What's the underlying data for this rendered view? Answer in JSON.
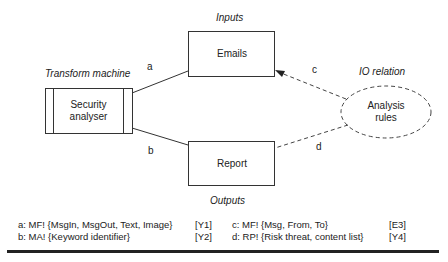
{
  "diagram": {
    "labels": {
      "inputs": "Inputs",
      "outputs": "Outputs",
      "transform_machine": "Transform machine",
      "io_relation": "IO relation"
    },
    "nodes": {
      "security_analyser": "Security analyser",
      "security_analyser_line1": "Security",
      "security_analyser_line2": "analyser",
      "emails": "Emails",
      "report": "Report",
      "analysis_rules_line1": "Analysis",
      "analysis_rules_line2": "rules"
    },
    "edges": {
      "a": "a",
      "b": "b",
      "c": "c",
      "d": "d"
    },
    "legend": [
      {
        "text": "a: MF! {MsgIn, MsgOut, Text, Image}",
        "tag": "[Y1]"
      },
      {
        "text": "b: MA! {Keyword identifier}",
        "tag": "[Y2]"
      },
      {
        "text": "c: MF! {Msg, From, To}",
        "tag": "[E3]"
      },
      {
        "text": "d: RP! {Risk threat, content list}",
        "tag": "[Y4]"
      }
    ]
  }
}
